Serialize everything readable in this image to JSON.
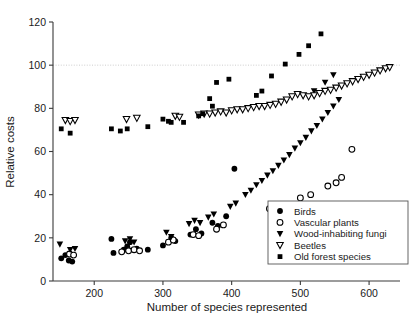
{
  "chart_data": {
    "type": "scatter",
    "title": "",
    "xlabel": "Number of species represented",
    "ylabel": "Relative costs",
    "xlim": [
      140,
      645
    ],
    "ylim": [
      0,
      120
    ],
    "xticks": [
      200,
      300,
      400,
      500,
      600
    ],
    "yticks": [
      0,
      20,
      40,
      60,
      80,
      100,
      120
    ],
    "grid": false,
    "reference_lines": [
      {
        "axis": "y",
        "value": 100,
        "style": "dotted",
        "color": "#c8c8c8"
      }
    ],
    "legend": {
      "position": "lower-right",
      "border": true
    },
    "series": [
      {
        "name": "Birds",
        "marker": "filled-circle",
        "color": "#000000",
        "points": [
          [
            152,
            10.5
          ],
          [
            158,
            12.0
          ],
          [
            163,
            9.5
          ],
          [
            168,
            9.0
          ],
          [
            225,
            19.5
          ],
          [
            228,
            13.0
          ],
          [
            243,
            14.5
          ],
          [
            248,
            16.0
          ],
          [
            252,
            18.0
          ],
          [
            262,
            15.0
          ],
          [
            278,
            14.5
          ],
          [
            300,
            16.5
          ],
          [
            312,
            20.0
          ],
          [
            318,
            18.5
          ],
          [
            340,
            21.5
          ],
          [
            348,
            24.0
          ],
          [
            356,
            22.0
          ],
          [
            372,
            27.0
          ],
          [
            380,
            25.5
          ],
          [
            392,
            30.0
          ],
          [
            404,
            52.0
          ]
        ]
      },
      {
        "name": "Vascular plants",
        "marker": "open-circle",
        "color": "#000000",
        "points": [
          [
            164,
            12.5
          ],
          [
            170,
            12.0
          ],
          [
            240,
            13.5
          ],
          [
            250,
            14.0
          ],
          [
            258,
            14.5
          ],
          [
            266,
            14.0
          ],
          [
            308,
            18.0
          ],
          [
            315,
            19.0
          ],
          [
            344,
            21.5
          ],
          [
            352,
            21.0
          ],
          [
            378,
            24.0
          ],
          [
            388,
            26.0
          ],
          [
            455,
            33.5
          ],
          [
            470,
            34.5
          ],
          [
            500,
            38.5
          ],
          [
            515,
            40.0
          ],
          [
            540,
            44.0
          ],
          [
            552,
            45.5
          ],
          [
            560,
            48.0
          ],
          [
            575,
            61.0
          ]
        ]
      },
      {
        "name": "Wood-inhabiting fungi",
        "marker": "filled-triangle-down",
        "color": "#000000",
        "points": [
          [
            150,
            17.0
          ],
          [
            165,
            14.5
          ],
          [
            172,
            15.0
          ],
          [
            245,
            18.5
          ],
          [
            252,
            19.5
          ],
          [
            258,
            18.0
          ],
          [
            305,
            22.5
          ],
          [
            312,
            20.5
          ],
          [
            338,
            26.5
          ],
          [
            346,
            28.0
          ],
          [
            354,
            27.0
          ],
          [
            366,
            29.5
          ],
          [
            374,
            31.0
          ],
          [
            398,
            34.5
          ],
          [
            406,
            36.0
          ],
          [
            420,
            40.0
          ],
          [
            428,
            42.0
          ],
          [
            436,
            44.5
          ],
          [
            444,
            46.5
          ],
          [
            452,
            49.0
          ],
          [
            460,
            51.0
          ],
          [
            468,
            53.5
          ],
          [
            476,
            56.0
          ],
          [
            484,
            58.5
          ],
          [
            492,
            61.5
          ],
          [
            500,
            64.0
          ],
          [
            508,
            66.5
          ],
          [
            516,
            69.5
          ],
          [
            524,
            72.0
          ],
          [
            532,
            75.0
          ],
          [
            540,
            78.0
          ],
          [
            548,
            81.0
          ],
          [
            556,
            84.0
          ],
          [
            520,
            88.0
          ],
          [
            536,
            92.0
          ],
          [
            548,
            95.5
          ]
        ]
      },
      {
        "name": "Beetles",
        "marker": "open-triangle-down",
        "color": "#000000",
        "points": [
          [
            158,
            74.5
          ],
          [
            165,
            74.0
          ],
          [
            172,
            74.5
          ],
          [
            247,
            75.0
          ],
          [
            262,
            75.5
          ],
          [
            318,
            76.5
          ],
          [
            324,
            76.0
          ],
          [
            352,
            77.0
          ],
          [
            360,
            77.5
          ],
          [
            368,
            77.5
          ],
          [
            376,
            78.0
          ],
          [
            384,
            78.5
          ],
          [
            392,
            78.0
          ],
          [
            400,
            79.0
          ],
          [
            408,
            79.5
          ],
          [
            416,
            79.5
          ],
          [
            424,
            80.0
          ],
          [
            432,
            80.5
          ],
          [
            440,
            81.0
          ],
          [
            448,
            81.0
          ],
          [
            456,
            81.5
          ],
          [
            464,
            82.0
          ],
          [
            472,
            83.0
          ],
          [
            480,
            84.0
          ],
          [
            488,
            85.5
          ],
          [
            496,
            86.5
          ],
          [
            504,
            86.0
          ],
          [
            512,
            85.5
          ],
          [
            520,
            86.0
          ],
          [
            528,
            87.0
          ],
          [
            536,
            88.0
          ],
          [
            544,
            88.5
          ],
          [
            552,
            89.5
          ],
          [
            560,
            90.5
          ],
          [
            568,
            91.5
          ],
          [
            576,
            92.5
          ],
          [
            584,
            93.5
          ],
          [
            592,
            94.5
          ],
          [
            600,
            95.5
          ],
          [
            608,
            96.5
          ],
          [
            616,
            97.5
          ],
          [
            624,
            98.5
          ],
          [
            630,
            99.0
          ]
        ]
      },
      {
        "name": "Old forest species",
        "marker": "filled-square",
        "color": "#000000",
        "points": [
          [
            152,
            70.5
          ],
          [
            165,
            68.5
          ],
          [
            225,
            70.5
          ],
          [
            238,
            69.5
          ],
          [
            248,
            70.5
          ],
          [
            278,
            71.5
          ],
          [
            300,
            75.0
          ],
          [
            308,
            74.0
          ],
          [
            312,
            73.5
          ],
          [
            330,
            73.5
          ],
          [
            352,
            76.5
          ],
          [
            358,
            77.5
          ],
          [
            368,
            84.5
          ],
          [
            372,
            81.0
          ],
          [
            378,
            92.0
          ],
          [
            396,
            93.5
          ],
          [
            436,
            86.0
          ],
          [
            444,
            88.0
          ],
          [
            458,
            95.0
          ],
          [
            478,
            100.5
          ],
          [
            498,
            105.0
          ],
          [
            512,
            109.0
          ],
          [
            530,
            114.5
          ]
        ]
      }
    ]
  },
  "legend_entries": [
    {
      "label": "Birds",
      "marker": "filled-circle"
    },
    {
      "label": "Vascular plants",
      "marker": "open-circle"
    },
    {
      "label": "Wood-inhabiting fungi",
      "marker": "filled-triangle-down"
    },
    {
      "label": "Beetles",
      "marker": "open-triangle-down"
    },
    {
      "label": "Old forest species",
      "marker": "filled-square"
    }
  ]
}
